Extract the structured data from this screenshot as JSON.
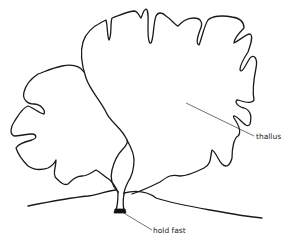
{
  "diagram": {
    "labels": {
      "thallus": "thallus",
      "holdfast": "hold fast"
    },
    "colors": {
      "stroke": "#1a1a1a",
      "background": "#ffffff"
    }
  }
}
